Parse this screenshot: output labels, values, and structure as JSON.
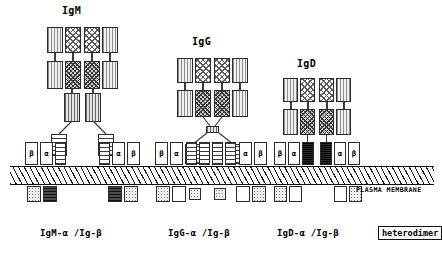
{
  "figure": {
    "caption_plasma_membrane": "PLASMA MEMBRANE",
    "legend_box": "heterodimer",
    "background": "#ffffff",
    "ink": "#111111"
  },
  "titles": {
    "igm": "IgM",
    "igg": "IgG",
    "igd": "IgD"
  },
  "footers": {
    "igm": "IgM-α /Ig-β",
    "igg": "IgG-α /Ig-β",
    "igd": "IgD-α /Ig-β"
  },
  "chain_labels": {
    "beta": "β",
    "alpha": "α"
  },
  "complexes": [
    {
      "id": "igm",
      "title": "IgM",
      "footer": "IgM-α /Ig-β",
      "membrane_subunits": [
        "β",
        "α",
        "",
        "",
        "α",
        "β"
      ],
      "has_hinge_knot": false,
      "stem_style": "striped-tall"
    },
    {
      "id": "igg",
      "title": "IgG",
      "footer": "IgG-α /Ig-β",
      "membrane_subunits": [
        "β",
        "α",
        "",
        "",
        "α",
        "β"
      ],
      "has_hinge_knot": true,
      "stem_style": "ladder"
    },
    {
      "id": "igd",
      "title": "IgD",
      "footer": "IgD-α /Ig-β",
      "membrane_subunits": [
        "β",
        "α",
        "",
        "",
        "α",
        "β"
      ],
      "has_hinge_knot": false,
      "stem_style": "thin-line"
    }
  ],
  "domain_fills": {
    "light_vertical_stripe": "#f2f2f2",
    "cross_hatch": "#fbfbfb",
    "dark_cross_hatch": "#c9c9c9",
    "horizontal_ladder": "#ffffff",
    "transmembrane_black": "#0a0a0a",
    "cytoplasmic_dotted": "#f0f0f0"
  }
}
